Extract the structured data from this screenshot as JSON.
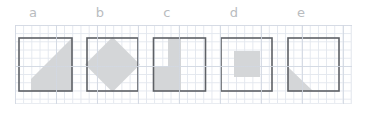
{
  "figure": {
    "name": "shaded-squares-grid-figure",
    "background_color": "#ffffff",
    "grid_color": "#e3e7ee",
    "grid_major_color": "#d2d8e2",
    "outline_color": "#5e6166",
    "shade_color": "#d4d6d8",
    "label_color": "#b9bcc0"
  },
  "labels": [
    {
      "text": "a",
      "left": 23
    },
    {
      "text": "b",
      "left": 90
    },
    {
      "text": "c",
      "left": 157
    },
    {
      "text": "d",
      "left": 224
    },
    {
      "text": "e",
      "left": 291
    }
  ],
  "panels": [
    {
      "id": "a",
      "label": "a",
      "left": 17,
      "shape": "square-with-diagonal-shaded-region",
      "description": "Square with the lower-right region shaded, bounded by a diagonal running from the top-right corner down to the mid-left edge"
    },
    {
      "id": "b",
      "label": "b",
      "left": 84,
      "shape": "square-with-inscribed-diamond",
      "description": "Square with a shaded diamond (rotated square) inscribed, vertices touching the midpoints of the sides"
    },
    {
      "id": "c",
      "label": "c",
      "left": 151,
      "shape": "square-with-l-shaped-region",
      "description": "Square with an L-shaped / stepped shaded region: a vertical bar on the upper middle plus a block in the lower left"
    },
    {
      "id": "d",
      "label": "d",
      "left": 218,
      "shape": "square-with-centered-square",
      "description": "Square with a smaller shaded square centered inside"
    },
    {
      "id": "e",
      "label": "e",
      "left": 285,
      "shape": "square-with-corner-triangle",
      "description": "Square with a small shaded right triangle in the lower-left corner"
    }
  ]
}
